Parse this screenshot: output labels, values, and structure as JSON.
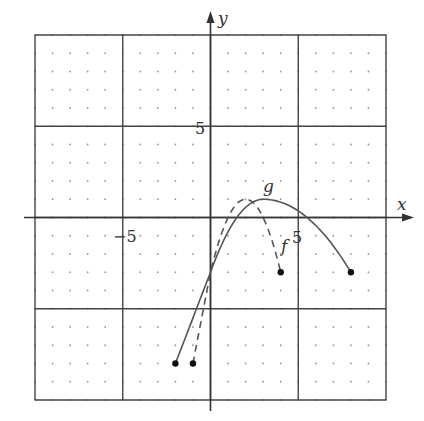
{
  "chart_data": {
    "type": "line",
    "title": "",
    "xlabel": "x",
    "ylabel": "y",
    "xlim": [
      -10,
      10
    ],
    "ylim": [
      -10,
      10
    ],
    "grid": "dotted minor (unit) with solid major every 5",
    "x_tick_labels": [
      "-5",
      "5"
    ],
    "y_tick_labels": [
      "5"
    ],
    "series": [
      {
        "name": "g",
        "style": "solid",
        "domain": [
          -2,
          8
        ],
        "start_point": [
          -2,
          -8
        ],
        "end_point": [
          8,
          -3
        ],
        "vertex": [
          3,
          1
        ],
        "y_intercept": -3,
        "points": [
          [
            -2,
            -8
          ],
          [
            0,
            -3
          ],
          [
            1,
            -1
          ],
          [
            2,
            0.5
          ],
          [
            3,
            1
          ],
          [
            4,
            0.5
          ],
          [
            5,
            -0.2
          ],
          [
            6,
            -1
          ],
          [
            7,
            -2
          ],
          [
            8,
            -3
          ]
        ]
      },
      {
        "name": "f",
        "style": "dashed",
        "domain": [
          -1,
          4
        ],
        "start_point": [
          -1,
          -8
        ],
        "end_point": [
          4,
          -3
        ],
        "vertex": [
          2,
          1
        ],
        "y_intercept": -3,
        "points": [
          [
            -1,
            -8
          ],
          [
            0,
            -3
          ],
          [
            1,
            0
          ],
          [
            2,
            1
          ],
          [
            3,
            0
          ],
          [
            4,
            -3
          ]
        ]
      }
    ],
    "annotations": [
      {
        "text": "g",
        "near": [
          3.3,
          1.7
        ]
      },
      {
        "text": "f",
        "near": [
          4.3,
          -1.5
        ]
      }
    ]
  },
  "labels": {
    "x_axis": "x",
    "y_axis": "y",
    "x_neg5": "−5",
    "x_pos5": "5",
    "y_pos5": "5",
    "g": "g",
    "f": "f"
  }
}
